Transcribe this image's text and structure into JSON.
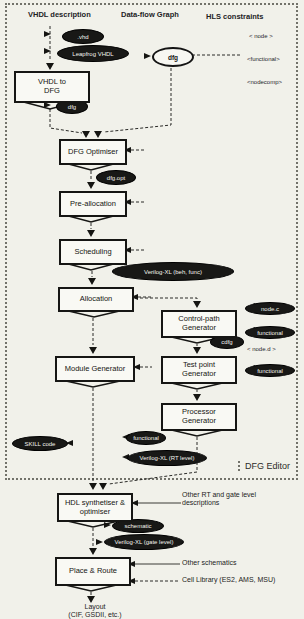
{
  "diagram": {
    "headers": [
      {
        "label": "VHDL description"
      },
      {
        "label": "Data-flow Graph"
      },
      {
        "label": "HLS constraints"
      }
    ],
    "boxes": {
      "vhdl_to_dfg": {
        "line1": "VHDL to",
        "line2": "DFG"
      },
      "dfg_optimiser": {
        "label": "DFG Optimiser"
      },
      "pre_allocation": {
        "label": "Pre-allocation"
      },
      "scheduling": {
        "label": "Scheduling"
      },
      "allocation": {
        "label": "Allocation"
      },
      "control_path_generator": {
        "line1": "Control-path",
        "line2": "Generator"
      },
      "module_generator": {
        "label": "Module Generator"
      },
      "test_point_generator": {
        "line1": "Test point",
        "line2": "Generator"
      },
      "processor_generator": {
        "line1": "Processor",
        "line2": "Generator"
      },
      "hdl_synthetiser": {
        "line1": "HDL synthetiser &",
        "line2": "optimiser"
      },
      "place_route": {
        "label": "Place & Route"
      }
    },
    "files": {
      "vhd": ".vhd",
      "leapfrog": "Leapfrog VHDL",
      "dfg_out": "dfg",
      "dfg_graph": "dfg",
      "dfg_opt": "dfg.opt",
      "verilog_beh": "Verilog-XL (beh, func)",
      "cdfg": "cdfg",
      "functional_out": "functional",
      "verilog_rt": "Verilog-XL (RT level)",
      "skill": "SKILL code",
      "schematic": "schematic",
      "verilog_gate": "Verilog-XL (gate level)"
    },
    "constraints_top": [
      "< node >",
      "<functional>",
      "<nodecomp>"
    ],
    "constraints_side": [
      "node.c",
      "functional",
      "< node.d >",
      "functional"
    ],
    "annotations": {
      "other_rt": "Other RT and gate level descriptions",
      "other_schematics": "Other schematics",
      "cell_library": "Cell Library (ES2, AMS, MSU)",
      "editor_label": "DFG Editor",
      "layout_line1": "Layout",
      "layout_line2": "(CIF, GSDII, etc.)"
    },
    "colors": {
      "paper": "#f1f1ea",
      "ink": "#1c1c1c",
      "pill_fill": "#181816",
      "pill_text": "#f4f4ee"
    }
  }
}
